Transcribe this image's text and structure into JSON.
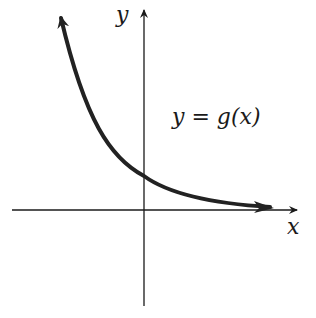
{
  "figure": {
    "x_axis_label": "x",
    "y_axis_label": "y",
    "curve_label": "y = g(x)",
    "curve_description": "Decreasing exponential-like curve, approaching the x-axis as x increases, crossing y-axis above origin, arrows on both ends",
    "colors": {
      "axes": "#1a1a1a",
      "curve": "#222222",
      "background": "#ffffff"
    }
  }
}
